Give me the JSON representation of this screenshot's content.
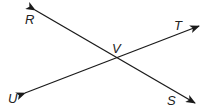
{
  "diagram": {
    "type": "intersecting-lines",
    "points": {
      "R": {
        "label": "R"
      },
      "S": {
        "label": "S"
      },
      "T": {
        "label": "T"
      },
      "U": {
        "label": "U"
      },
      "V": {
        "label": "V"
      }
    },
    "lines": [
      {
        "name": "line-RS",
        "from": "R",
        "to": "S"
      },
      {
        "name": "line-UT",
        "from": "U",
        "to": "T"
      }
    ],
    "intersection": "V"
  }
}
